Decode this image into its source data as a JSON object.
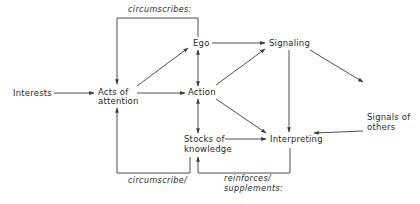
{
  "diagram": {
    "nodes": [
      {
        "id": "interests",
        "lines": [
          "Interests"
        ]
      },
      {
        "id": "acts_of_attention",
        "lines": [
          "Acts of",
          "attention"
        ]
      },
      {
        "id": "ego",
        "lines": [
          "Ego"
        ]
      },
      {
        "id": "action",
        "lines": [
          "Action"
        ]
      },
      {
        "id": "stocks_of_knowledge",
        "lines": [
          "Stocks of",
          "knowledge"
        ]
      },
      {
        "id": "signaling",
        "lines": [
          "Signaling"
        ]
      },
      {
        "id": "interpreting",
        "lines": [
          "Interpreting"
        ]
      },
      {
        "id": "signals_of_others",
        "lines": [
          "Signals of",
          "others"
        ]
      }
    ],
    "labels": {
      "top_loop": "circumscribes:",
      "bottom_left_loop": "circumscribe/",
      "bottom_right_loop": [
        "reinforces/",
        "supplements:"
      ]
    },
    "edges": [
      {
        "from": "interests",
        "to": "acts_of_attention"
      },
      {
        "from": "acts_of_attention",
        "to": "action"
      },
      {
        "from": "acts_of_attention",
        "to": "ego"
      },
      {
        "from": "ego",
        "to": "signaling"
      },
      {
        "from": "ego",
        "to": "action",
        "bidirectional": true
      },
      {
        "from": "action",
        "to": "stocks_of_knowledge",
        "bidirectional": true
      },
      {
        "from": "action",
        "to": "signaling"
      },
      {
        "from": "action",
        "to": "interpreting"
      },
      {
        "from": "stocks_of_knowledge",
        "to": "interpreting"
      },
      {
        "from": "signaling",
        "to": "interpreting"
      },
      {
        "from": "signaling",
        "to": "signals_of_others"
      },
      {
        "from": "signals_of_others",
        "to": "interpreting"
      },
      {
        "from": "ego",
        "to": "acts_of_attention",
        "label": "circumscribes:"
      },
      {
        "from": "stocks_of_knowledge",
        "to": "acts_of_attention",
        "label": "circumscribe/"
      },
      {
        "from": "interpreting",
        "to": "stocks_of_knowledge",
        "label": "reinforces/ supplements:"
      }
    ]
  }
}
